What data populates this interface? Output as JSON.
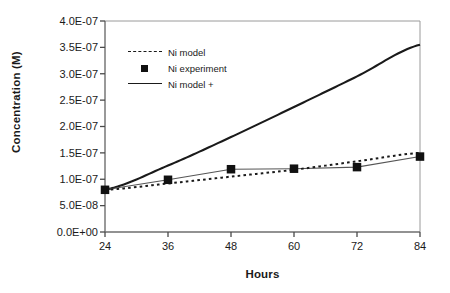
{
  "chart_data": {
    "type": "line",
    "title": "",
    "xlabel": "Hours",
    "ylabel": "Concentration (M)",
    "x": [
      24,
      36,
      48,
      60,
      72,
      84
    ],
    "xlim": [
      24,
      84
    ],
    "ylim": [
      0,
      4e-07
    ],
    "xticks": [
      "24",
      "36",
      "48",
      "60",
      "72",
      "84"
    ],
    "yticks": [
      "0.0E+00",
      "5.0E-08",
      "1.0E-07",
      "1.5E-07",
      "2.0E-07",
      "2.5E-07",
      "3.0E-07",
      "3.5E-07",
      "4.0E-07"
    ],
    "ytick_values": [
      0,
      5e-08,
      1e-07,
      1.5e-07,
      2e-07,
      2.5e-07,
      3e-07,
      3.5e-07,
      4e-07
    ],
    "grid": false,
    "legend_position": "upper-left-inside",
    "series": [
      {
        "name": "Ni  model",
        "style": "dashed",
        "color": "#1a1a1a",
        "marker": "none",
        "values": [
          8e-08,
          9.2e-08,
          1.05e-07,
          1.18e-07,
          1.34e-07,
          1.5e-07
        ]
      },
      {
        "name": "Ni  experiment",
        "style": "solid-thin",
        "color": "#1a1a1a",
        "marker": "square",
        "values": [
          8e-08,
          9.9e-08,
          1.19e-07,
          1.2e-07,
          1.23e-07,
          1.43e-07
        ]
      },
      {
        "name": "Ni  model +",
        "style": "solid",
        "color": "#1a1a1a",
        "marker": "none",
        "values": [
          8e-08,
          1.26e-07,
          1.8e-07,
          2.37e-07,
          2.95e-07,
          3.55e-07
        ]
      }
    ]
  },
  "axes": {
    "y_title": "Concentration (M)",
    "x_title": "Hours"
  },
  "legend": {
    "items": [
      {
        "label": "Ni  model",
        "key": "dashed-line-key"
      },
      {
        "label": "Ni  experiment",
        "key": "square-marker-key"
      },
      {
        "label": "Ni  model +",
        "key": "solid-line-key"
      }
    ]
  }
}
